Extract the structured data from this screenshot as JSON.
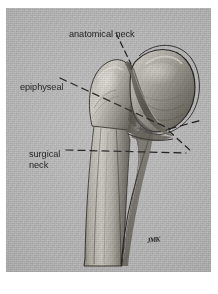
{
  "figure": {
    "name": "proximal-humerus-anatomy-plate",
    "caption_labels": {
      "anatomical_neck": "anatomical neck",
      "epiphyseal": "epiphyseal",
      "surgical_neck": "surgical\nneck"
    },
    "signature": "JMK",
    "colors": {
      "paper": "#bdbdbd",
      "ink": "#141414",
      "bone_light": "#d8d5cf",
      "bone_mid": "#9a968f",
      "bone_dark": "#4a4741",
      "page": "#ffffff"
    },
    "plate": {
      "x": 6,
      "y": 8,
      "width": 205,
      "height": 264
    },
    "leader_lines": [
      {
        "name": "anatomical-neck-leader",
        "style": "dashed",
        "from": [
          116,
          33
        ],
        "to": [
          131,
          62
        ]
      },
      {
        "name": "epiphyseal-line",
        "style": "dashed",
        "from": [
          60,
          78
        ],
        "to": [
          170,
          128
        ]
      },
      {
        "name": "surgical-neck-line",
        "style": "dashed",
        "from": [
          66,
          150
        ],
        "to": [
          186,
          153
        ]
      },
      {
        "name": "anatomical-neck-axis-right",
        "style": "dashed",
        "from": [
          168,
          129
        ],
        "to": [
          201,
          120
        ]
      },
      {
        "name": "epiphyseal-axis-right",
        "style": "dashed",
        "from": [
          168,
          130
        ],
        "to": [
          190,
          150
        ]
      }
    ]
  }
}
